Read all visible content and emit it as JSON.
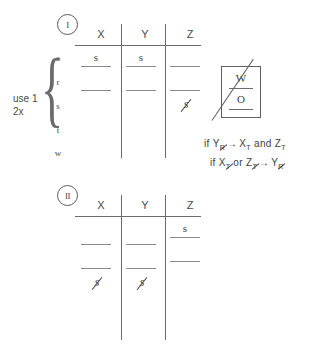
{
  "figure": {
    "ink_color": "#4a4a4a"
  },
  "table_one": {
    "badge": "I",
    "columns": [
      "X",
      "Y",
      "Z"
    ],
    "row_labels": [
      "o",
      "r",
      "s",
      "t",
      "w"
    ],
    "side_note_line1": "use 1",
    "side_note_line2": "2x",
    "cells": [
      {
        "row": "o",
        "col": "X",
        "value": "s",
        "state": "filled"
      },
      {
        "row": "o",
        "col": "Y",
        "value": "s",
        "state": "filled"
      },
      {
        "row": "o",
        "col": "Z",
        "value": "",
        "state": "blank"
      },
      {
        "row": "r",
        "col": "X",
        "value": "",
        "state": "blank"
      },
      {
        "row": "r",
        "col": "Y",
        "value": "",
        "state": "blank"
      },
      {
        "row": "r",
        "col": "Z",
        "value": "",
        "state": "blank"
      },
      {
        "row": "s",
        "col": "Z",
        "value": "s",
        "state": "struck"
      }
    ]
  },
  "table_two": {
    "badge": "II",
    "columns": [
      "X",
      "Y",
      "Z"
    ],
    "cells": [
      {
        "row": 1,
        "col": "Z",
        "value": "s",
        "state": "filled"
      },
      {
        "row": 2,
        "col": "X",
        "value": "",
        "state": "blank"
      },
      {
        "row": 2,
        "col": "Y",
        "value": "",
        "state": "blank"
      },
      {
        "row": 2,
        "col": "Z",
        "value": "",
        "state": "blank"
      },
      {
        "row": 3,
        "col": "X",
        "value": "",
        "state": "blank"
      },
      {
        "row": 3,
        "col": "Y",
        "value": "",
        "state": "blank"
      },
      {
        "row": 3,
        "col": "Z",
        "value": "",
        "state": "blank"
      },
      {
        "row": 4,
        "col": "X",
        "value": "s",
        "state": "struck"
      },
      {
        "row": 4,
        "col": "Y",
        "value": "s",
        "state": "struck"
      }
    ]
  },
  "wo_box": {
    "top_letter": "W",
    "bottom_letter": "O",
    "crossed_out": true
  },
  "conditions": {
    "line1": {
      "prefix": "if",
      "antecedent_base": "Y",
      "antecedent_sub": "R",
      "arrow": "→",
      "consequent1_base": "X",
      "consequent1_sub": "T",
      "conjunction": "and",
      "consequent2_base": "Z",
      "consequent2_sub": "T"
    },
    "line2": {
      "prefix": "if",
      "antecedent1_base": "X",
      "antecedent1_sub": "T",
      "disjunction": "or",
      "antecedent2_base": "Z",
      "antecedent2_sub": "T",
      "arrow": "→",
      "consequent_base": "Y",
      "consequent_sub": "R"
    }
  }
}
